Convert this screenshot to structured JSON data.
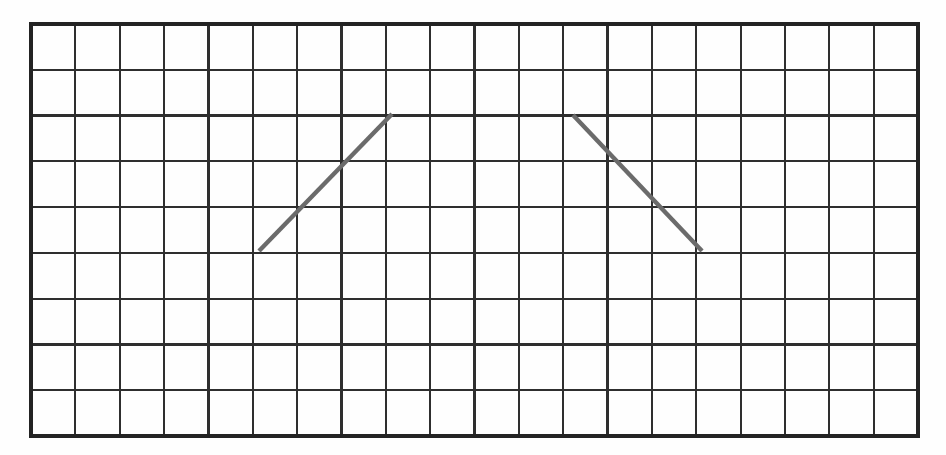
{
  "figure": {
    "title": "",
    "title_note": "cropped-off-top-edge",
    "background_color": "#fefefe"
  },
  "grid": {
    "columns": 20,
    "rows": 9,
    "x": 31,
    "y": 24,
    "width": 887,
    "height": 412,
    "cell_width": 44.35,
    "cell_height": 45.78,
    "line_color": "#2e2e2e",
    "line_width": 2.2,
    "border_color": "#232323",
    "border_width": 3.2
  },
  "chart_data": {
    "type": "line",
    "title": "",
    "xlabel": "",
    "ylabel": "",
    "grid": true,
    "legend": "none",
    "xlim": [
      0,
      20
    ],
    "ylim": [
      0,
      9
    ],
    "series": [
      {
        "name": "ascending-segment",
        "color": "#6b6b6b",
        "slope": 1,
        "grid_points": [
          [
            5,
            4
          ],
          [
            8,
            7
          ]
        ],
        "pixel_points": [
          [
            259,
            251
          ],
          [
            392,
            114
          ]
        ]
      },
      {
        "name": "descending-segment",
        "color": "#6b6b6b",
        "slope": -1,
        "grid_points": [
          [
            12,
            7
          ],
          [
            15,
            4
          ]
        ],
        "pixel_points": [
          [
            573,
            115
          ],
          [
            702,
            251
          ]
        ]
      }
    ]
  }
}
